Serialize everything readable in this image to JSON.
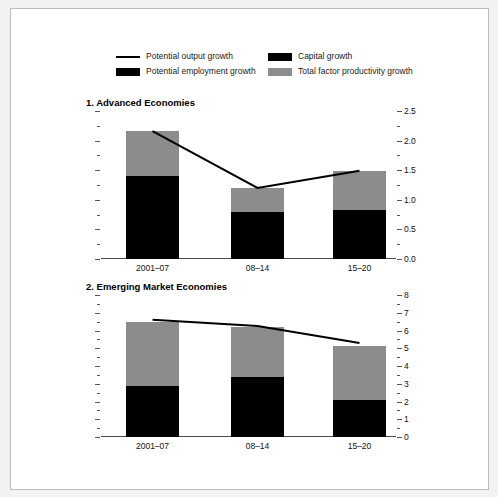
{
  "legend": {
    "rows": [
      [
        {
          "label": "Potential output growth",
          "marker": "line",
          "color": "#000000"
        },
        {
          "label": "Capital growth",
          "marker": "swatch",
          "color": "#000000"
        }
      ],
      [
        {
          "label": "Potential employment growth",
          "marker": "swatch",
          "color": "#000000"
        },
        {
          "label": "Total factor productivity growth",
          "marker": "swatch",
          "color": "#8c8c8c"
        }
      ]
    ]
  },
  "colors": {
    "black": "#000000",
    "gray": "#8c8c8c",
    "axis": "#4d4d4d",
    "page_background": "#f2f2f2",
    "panel_background": "#ffffff"
  },
  "chart_data": [
    {
      "type": "bar",
      "title": "1. Advanced Economies",
      "xlabel": "",
      "ylabel": "",
      "categories": [
        "2001–07",
        "08–14",
        "15–20"
      ],
      "ylim": [
        0.0,
        2.5
      ],
      "yticks": [
        0.0,
        0.5,
        1.0,
        1.5,
        2.0,
        2.5
      ],
      "ytick_labels": [
        "0.0",
        "0.5",
        "1.0",
        "1.5",
        "2.0",
        "2.5"
      ],
      "minor_ticks": true,
      "grid": false,
      "legend_position": "top",
      "stacked": true,
      "series": [
        {
          "name": "Potential employment growth",
          "color": "#000000",
          "values": [
            1.4,
            0.79,
            0.83
          ]
        },
        {
          "name": "Total factor productivity growth",
          "color": "#8c8c8c",
          "values": [
            0.76,
            0.41,
            0.66
          ]
        }
      ],
      "line_series": {
        "name": "Potential output growth",
        "color": "#000000",
        "values": [
          2.16,
          1.2,
          1.49
        ]
      }
    },
    {
      "type": "bar",
      "title": "2. Emerging Market Economies",
      "xlabel": "",
      "ylabel": "",
      "categories": [
        "2001–07",
        "08–14",
        "15–20"
      ],
      "ylim": [
        0,
        8
      ],
      "yticks": [
        0,
        1,
        2,
        3,
        4,
        5,
        6,
        7,
        8
      ],
      "ytick_labels": [
        "0",
        "1",
        "2",
        "3",
        "4",
        "5",
        "6",
        "7",
        "8"
      ],
      "minor_ticks": true,
      "grid": false,
      "legend_position": "top",
      "stacked": true,
      "series": [
        {
          "name": "Potential employment growth",
          "color": "#000000",
          "values": [
            2.87,
            3.4,
            2.1
          ]
        },
        {
          "name": "Total factor productivity growth",
          "color": "#8c8c8c",
          "values": [
            3.63,
            2.8,
            3.0
          ]
        }
      ],
      "line_series": {
        "name": "Potential output growth",
        "color": "#000000",
        "values": [
          6.6,
          6.25,
          5.3
        ]
      }
    }
  ]
}
